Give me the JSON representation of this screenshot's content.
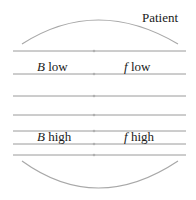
{
  "diagram": {
    "patient_label": "Patient",
    "labels": {
      "low_left_var": "B",
      "low_left_text": " low",
      "low_right_var": "f",
      "low_right_text": " low",
      "high_left_var": "B",
      "high_left_text": " high",
      "high_right_var": "f",
      "high_right_text": " high"
    },
    "line_color": "#9a9a9a",
    "arc_color": "#a8a8a8",
    "line_count": 7
  }
}
